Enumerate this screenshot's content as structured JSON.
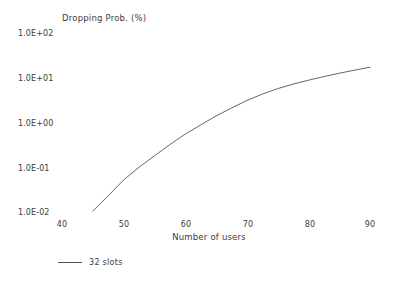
{
  "chart_data": {
    "type": "line",
    "title": "",
    "ylabel": "Dropping Prob. (%)",
    "xlabel": "Number of users",
    "yscale": "log",
    "xscale": "linear",
    "xlim": [
      40,
      90
    ],
    "ylim": [
      0.01,
      100
    ],
    "grid": false,
    "legend_position": "below-left",
    "xticks": [
      40,
      50,
      60,
      70,
      80,
      90
    ],
    "xtick_labels": [
      "40",
      "50",
      "60",
      "70",
      "80",
      "90"
    ],
    "yticks": [
      0.01,
      0.1,
      1,
      10,
      100
    ],
    "ytick_labels": [
      "1.0E-02",
      "1.0E-01",
      "1.0E+00",
      "1.0E+01",
      "1.0E+02"
    ],
    "series": [
      {
        "name": "32 slots",
        "color": "#555555",
        "x": [
          45,
          47.5,
          50,
          52.5,
          55,
          57.5,
          60,
          62.5,
          65,
          67.5,
          70,
          72.5,
          75,
          77.5,
          80,
          82.5,
          85,
          87.5,
          90
        ],
        "values": [
          0.0105,
          0.023,
          0.052,
          0.1,
          0.18,
          0.32,
          0.55,
          0.88,
          1.4,
          2.1,
          3.1,
          4.3,
          5.7,
          7.2,
          8.8,
          10.6,
          12.6,
          14.8,
          17.2
        ]
      }
    ]
  },
  "legend": {
    "entries": [
      {
        "label": "32 slots",
        "marker": "line-swatch"
      }
    ]
  },
  "axes": {
    "y_axis_title": "Dropping Prob. (%)",
    "x_axis_title": "Number of users"
  }
}
